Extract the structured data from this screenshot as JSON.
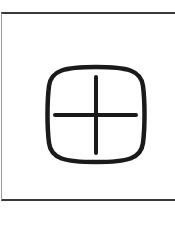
{
  "icon": {
    "name": "circled-plus-icon",
    "stroke_color": "#1a1a1a"
  },
  "frame": {
    "border_color": "#3a3a3a"
  }
}
